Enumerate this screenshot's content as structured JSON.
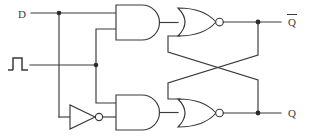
{
  "diagram": {
    "type": "logic-circuit",
    "colors": {
      "line": "#3a3a3a",
      "fill": "#ffffff",
      "junction": "#2b2b2b",
      "background": "#ffffff"
    }
  },
  "inputs": [
    {
      "id": "d",
      "label": "D",
      "name": "data-input",
      "symbol": "text"
    },
    {
      "id": "clk",
      "label": "",
      "name": "clock-input",
      "symbol": "pulse-waveform"
    }
  ],
  "outputs": [
    {
      "id": "qbar",
      "label": "Q",
      "overbar": true,
      "name": "q-bar-output"
    },
    {
      "id": "q",
      "label": "Q",
      "overbar": false,
      "name": "q-output"
    }
  ],
  "gates": [
    {
      "id": "and-top",
      "type": "AND",
      "label": "",
      "name": "and-gate-top",
      "inputs": 2
    },
    {
      "id": "and-bottom",
      "type": "AND",
      "label": "",
      "name": "and-gate-bottom",
      "inputs": 2
    },
    {
      "id": "nor-top",
      "type": "NOR",
      "label": "",
      "name": "nor-gate-top",
      "inputs": 2
    },
    {
      "id": "nor-bottom",
      "type": "NOR",
      "label": "",
      "name": "nor-gate-bottom",
      "inputs": 2
    },
    {
      "id": "not-1",
      "type": "NOT",
      "label": "",
      "name": "inverter-gate",
      "inputs": 1
    }
  ],
  "junctions": [
    {
      "id": "j-d",
      "name": "junction-d-branch"
    },
    {
      "id": "j-clk",
      "name": "junction-clock-branch"
    },
    {
      "id": "j-qbar",
      "name": "junction-q-bar-feedback"
    },
    {
      "id": "j-q",
      "name": "junction-q-feedback"
    }
  ]
}
